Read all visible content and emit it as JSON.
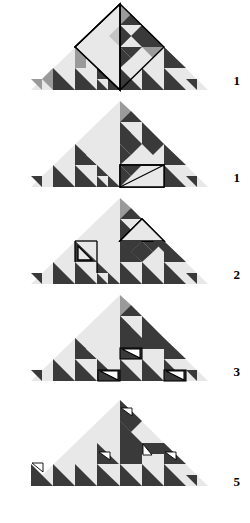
{
  "figure": {
    "name": "fibonacci-triangle-tiling-sequence",
    "background_color": "#ffffff",
    "colors": {
      "light_fill": "#e8e8e8",
      "mid_fill": "#9a9a9a",
      "dark_fill": "#3a3a3a",
      "white_fill": "#ffffff",
      "outline": "#000000"
    },
    "geometry": {
      "apex_x": 120,
      "base_left_x": 31,
      "base_right_x": 208,
      "base_y": 90,
      "apex_y": 4,
      "panel_height": 97,
      "panel_count": 5
    }
  },
  "panels": [
    {
      "id": "panel-1",
      "label": "1",
      "top": 14,
      "label_top": 94,
      "cells": [
        {
          "col": 0,
          "variant": "A"
        },
        {
          "col": 1,
          "variant": "B"
        },
        {
          "col": 2,
          "variant": "C"
        },
        {
          "col": 3,
          "variant": "D"
        }
      ],
      "highlights": [
        {
          "shape": "diamond",
          "points": "120,4 75,47 120,90 164,47",
          "stroke_width": 1.4
        }
      ]
    },
    {
      "id": "panel-2",
      "label": "1",
      "top": 111,
      "label_top": 191,
      "highlights": [
        {
          "shape": "square",
          "points": "120,68 164,68 164,90 120,90",
          "stroke_width": 1.4
        },
        {
          "shape": "diagonal",
          "points": "120,90 164,68",
          "stroke_width": 1.2
        }
      ]
    },
    {
      "id": "panel-3",
      "label": "2",
      "top": 208,
      "label_top": 288,
      "highlights": [
        {
          "shape": "triangle-left",
          "points": "75,47 97,47 97,68",
          "stroke_width": 1.3
        },
        {
          "shape": "triangle-top",
          "points": "120,47 142,25 164,47",
          "stroke_width": 1.3
        }
      ]
    },
    {
      "id": "panel-4",
      "label": "3",
      "top": 305,
      "label_top": 385,
      "highlights": [
        {
          "shape": "small-triangle",
          "points": "98,79 120,79 120,90",
          "stroke_width": 1.2
        },
        {
          "shape": "small-triangle",
          "points": "120,57 142,57 142,68",
          "stroke_width": 1.2
        },
        {
          "shape": "small-triangle",
          "points": "164,79 186,79 186,90",
          "stroke_width": 1.2
        }
      ]
    },
    {
      "id": "panel-5",
      "label": "5",
      "top": 402,
      "label_top": 482,
      "highlights": [
        {
          "shape": "tiny-triangle",
          "points": "120,14 131,14 131,20"
        },
        {
          "shape": "tiny-triangle",
          "points": "98,57 109,57 109,63"
        },
        {
          "shape": "tiny-triangle",
          "points": "142,47 142,58 153,58"
        },
        {
          "shape": "tiny-triangle",
          "points": "164,57 175,57 175,63"
        },
        {
          "shape": "tiny-triangle",
          "points": "31,79 42,79 42,90"
        }
      ]
    }
  ],
  "labels": {
    "values": [
      "1",
      "1",
      "2",
      "3",
      "5"
    ]
  }
}
